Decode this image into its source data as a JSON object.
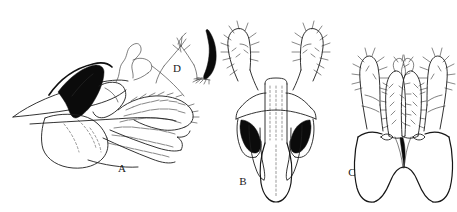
{
  "figure": {
    "kind": "scientific-line-drawing-plate",
    "background_color": "#ffffff",
    "ink_color": "#1d1d1d",
    "fill_color": "#0b0b0b",
    "width": 457,
    "height": 212,
    "panels": [
      {
        "id": "A",
        "label": "A",
        "label_x": 122,
        "label_y": 172,
        "caption": "A",
        "view": "lateral",
        "description": "Lateral view of genital capsule with elongate pointed process, solid black sclerotized wedge, and densely setose lobe"
      },
      {
        "id": "B",
        "label": "B",
        "label_x": 243,
        "label_y": 185,
        "caption": "B",
        "view": "ventral",
        "description": "Ventral view of genital capsule with paired setose surstyli, paired solid black sclerites and median aedeagus"
      },
      {
        "id": "C",
        "label": "C",
        "label_x": 352,
        "label_y": 176,
        "caption": "C",
        "view": "dorsal",
        "description": "Dorsal view with paired setose cerci, setose inner lobes and bilobed epandrium with median notch"
      },
      {
        "id": "D",
        "label": "D",
        "label_x": 177,
        "label_y": 72,
        "caption": "D",
        "view": "detail",
        "description": "Enlarged detail of apex with solid black curved claw-like spine"
      }
    ],
    "footer_text": ""
  }
}
